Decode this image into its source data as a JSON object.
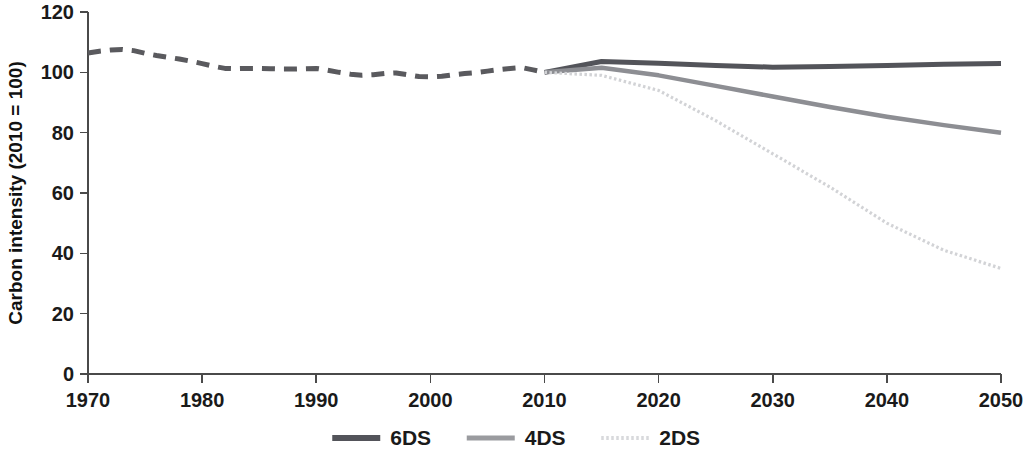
{
  "chart_data": {
    "type": "line",
    "title": "",
    "xlabel": "",
    "ylabel": "Carbon intensity (2010 = 100)",
    "xlim": [
      1970,
      2050
    ],
    "ylim": [
      0,
      120
    ],
    "xticks": [
      1970,
      1980,
      1990,
      2000,
      2010,
      2020,
      2030,
      2040,
      2050
    ],
    "yticks": [
      0,
      20,
      40,
      60,
      80,
      100,
      120
    ],
    "grid": false,
    "legend_position": "bottom-center",
    "series": [
      {
        "name": "historical",
        "label": "",
        "style": "dashed",
        "color": "#5a5a5e",
        "width": 5,
        "in_legend": false,
        "x": [
          1970,
          1971,
          1972,
          1973,
          1974,
          1975,
          1976,
          1977,
          1978,
          1979,
          1980,
          1981,
          1982,
          1983,
          1984,
          1985,
          1986,
          1987,
          1988,
          1989,
          1990,
          1991,
          1992,
          1993,
          1994,
          1995,
          1996,
          1997,
          1998,
          1999,
          2000,
          2001,
          2002,
          2003,
          2004,
          2005,
          2006,
          2007,
          2008,
          2009,
          2010
        ],
        "y": [
          106.4,
          107.0,
          107.4,
          107.6,
          107.2,
          106.3,
          105.6,
          105.0,
          104.4,
          103.7,
          102.9,
          102.0,
          101.3,
          101.2,
          101.3,
          101.3,
          101.2,
          101.1,
          101.1,
          101.2,
          101.3,
          100.7,
          100.0,
          99.4,
          99.0,
          99.2,
          99.6,
          99.8,
          99.2,
          98.6,
          98.5,
          98.7,
          99.2,
          99.6,
          99.9,
          100.4,
          100.9,
          101.3,
          101.6,
          100.8,
          100.0
        ]
      },
      {
        "name": "6DS",
        "label": "6DS",
        "style": "solid",
        "color": "#53545a",
        "width": 5,
        "in_legend": true,
        "x": [
          2010,
          2015,
          2020,
          2025,
          2030,
          2035,
          2040,
          2045,
          2050
        ],
        "y": [
          100.0,
          103.6,
          103.0,
          102.3,
          101.7,
          101.9,
          102.3,
          102.7,
          102.9
        ]
      },
      {
        "name": "4DS",
        "label": "4DS",
        "style": "solid",
        "color": "#8d8e93",
        "width": 4.5,
        "in_legend": true,
        "x": [
          2010,
          2015,
          2020,
          2025,
          2030,
          2035,
          2040,
          2045,
          2050
        ],
        "y": [
          100.0,
          101.5,
          99.0,
          95.5,
          92.0,
          88.5,
          85.3,
          82.5,
          80.0
        ]
      },
      {
        "name": "2DS",
        "label": "2DS",
        "style": "dotted",
        "color": "#d2d3d6",
        "width": 3.2,
        "in_legend": true,
        "x": [
          2010,
          2015,
          2020,
          2025,
          2030,
          2035,
          2040,
          2045,
          2050
        ],
        "y": [
          100.0,
          99.0,
          94.0,
          84.0,
          73.0,
          62.0,
          50.0,
          41.0,
          35.0
        ]
      }
    ],
    "legend": [
      {
        "label": "6DS",
        "color": "#53545a",
        "style": "solid",
        "width": 6
      },
      {
        "label": "4DS",
        "color": "#9a9b9f",
        "style": "solid",
        "width": 5
      },
      {
        "label": "2DS",
        "color": "#d8d9dc",
        "style": "dotted",
        "width": 4
      }
    ]
  }
}
